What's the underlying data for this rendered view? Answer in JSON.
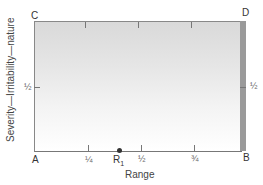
{
  "diagram": {
    "corners": {
      "A": "A",
      "B": "B",
      "C": "C",
      "D": "D"
    },
    "x_axis": {
      "title": "Range",
      "tick_labels": [
        "¼",
        "½",
        "¾"
      ]
    },
    "y_axis": {
      "title": "Severity—Irritability—nature",
      "tick_label_left": "½",
      "tick_label_right": "½"
    },
    "point": {
      "label": "R",
      "subscript": "1",
      "position_fraction": 0.4
    },
    "colors": {
      "gradient_top": "#d9d9d9",
      "gradient_bottom": "#ffffff",
      "edge_bar": "#9a9a9a",
      "axis": "#777777"
    }
  }
}
